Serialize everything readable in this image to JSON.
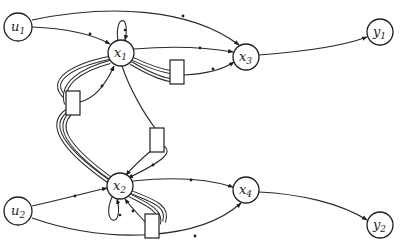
{
  "diagram": {
    "type": "signal-flow graph",
    "nodes": [
      {
        "id": "u1",
        "base": "u",
        "sub": "1",
        "x": 18,
        "y": 27
      },
      {
        "id": "x1",
        "base": "x",
        "sub": "1",
        "x": 121,
        "y": 53
      },
      {
        "id": "x3",
        "base": "x",
        "sub": "3",
        "x": 246,
        "y": 57
      },
      {
        "id": "y1",
        "base": "y",
        "sub": "1",
        "x": 380,
        "y": 32
      },
      {
        "id": "u2",
        "base": "u",
        "sub": "2",
        "x": 18,
        "y": 211
      },
      {
        "id": "x2",
        "base": "x",
        "sub": "2",
        "x": 120,
        "y": 186
      },
      {
        "id": "x4",
        "base": "x",
        "sub": "4",
        "x": 246,
        "y": 190
      },
      {
        "id": "y2",
        "base": "y",
        "sub": "2",
        "x": 380,
        "y": 225
      }
    ],
    "boxes": [
      {
        "id": "box-x1-x3",
        "x": 170,
        "y": 60,
        "w": 14,
        "h": 24
      },
      {
        "id": "box-x1-x2-left",
        "x": 66,
        "y": 91,
        "w": 14,
        "h": 24
      },
      {
        "id": "box-x1-x2-right",
        "x": 150,
        "y": 128,
        "w": 14,
        "h": 24
      },
      {
        "id": "box-x2-self",
        "x": 145,
        "y": 214,
        "w": 14,
        "h": 24
      }
    ],
    "edges": [
      {
        "from": "u1",
        "to": "x1"
      },
      {
        "from": "u1",
        "to": "x3"
      },
      {
        "from": "x1",
        "to": "x1",
        "kind": "self-loop"
      },
      {
        "from": "x1",
        "to": "x3"
      },
      {
        "from": "x1",
        "to": "box-x1-x3",
        "kind": "double"
      },
      {
        "from": "box-x1-x3",
        "to": "x3"
      },
      {
        "from": "x3",
        "to": "y1"
      },
      {
        "from": "x1",
        "to": "box-x1-x2-left",
        "kind": "double"
      },
      {
        "from": "box-x1-x2-left",
        "to": "x1"
      },
      {
        "from": "box-x1-x2-left",
        "to": "x2",
        "kind": "double"
      },
      {
        "from": "x1",
        "to": "box-x1-x2-right"
      },
      {
        "from": "box-x1-x2-right",
        "to": "x2"
      },
      {
        "from": "u2",
        "to": "x2"
      },
      {
        "from": "u2",
        "to": "x4"
      },
      {
        "from": "x2",
        "to": "x2",
        "kind": "self-loop"
      },
      {
        "from": "x2",
        "to": "x4"
      },
      {
        "from": "x2",
        "to": "box-x2-self",
        "kind": "double"
      },
      {
        "from": "box-x2-self",
        "to": "x2"
      },
      {
        "from": "x4",
        "to": "y2"
      }
    ]
  },
  "labels": {
    "u1": {
      "base": "u",
      "sub": "1"
    },
    "x1": {
      "base": "x",
      "sub": "1"
    },
    "x3": {
      "base": "x",
      "sub": "3"
    },
    "y1": {
      "base": "y",
      "sub": "1"
    },
    "u2": {
      "base": "u",
      "sub": "2"
    },
    "x2": {
      "base": "x",
      "sub": "2"
    },
    "x4": {
      "base": "x",
      "sub": "4"
    },
    "y2": {
      "base": "y",
      "sub": "2"
    }
  }
}
